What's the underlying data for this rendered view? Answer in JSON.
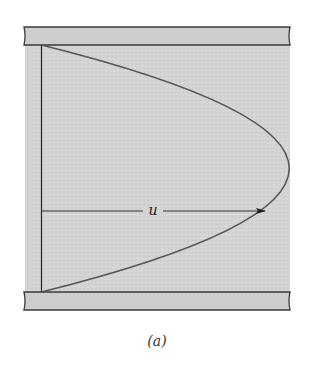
{
  "figure": {
    "velocity_label": "u",
    "caption": "(a)",
    "colors": {
      "fluid_fill": "#d6d6d6",
      "plate_fill": "#cfcfcf",
      "plate_stroke": "#3a3a3a",
      "profile_stroke": "#555555",
      "axis_stroke": "#222222",
      "background": "#ffffff"
    }
  }
}
